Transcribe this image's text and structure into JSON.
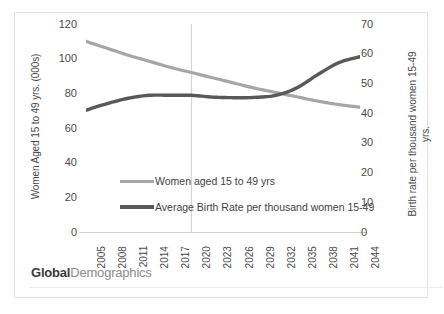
{
  "chart_data": {
    "type": "line",
    "title": "",
    "xlabel": "",
    "grid": false,
    "legend_position": "inside-center",
    "x": [
      2005,
      2008,
      2011,
      2014,
      2017,
      2020,
      2023,
      2026,
      2029,
      2032,
      2035,
      2038,
      2041,
      2044
    ],
    "axes": {
      "left": {
        "label": "Women Aged 15 to 49 yrs. (000s)",
        "ticks": [
          0,
          20,
          40,
          60,
          80,
          100,
          120
        ],
        "lim": [
          0,
          120
        ]
      },
      "right": {
        "label_line1": "Birth rate per thousand women 15-49",
        "label_line2": "yrs.",
        "ticks": [
          0,
          10,
          20,
          30,
          40,
          50,
          60,
          70
        ],
        "lim": [
          0,
          70
        ]
      }
    },
    "series": [
      {
        "name": "Women aged 15 to 49 yrs",
        "axis": "left",
        "color": "#a6a6a6",
        "values": [
          110,
          106,
          102,
          98.5,
          95,
          92,
          89,
          86,
          83,
          80.5,
          78,
          75.5,
          73.5,
          72
        ]
      },
      {
        "name": "Average Birth Rate per thousand women 15-49",
        "axis": "right",
        "color": "#595959",
        "values": [
          41,
          43.2,
          45,
          46,
          46,
          46,
          45.4,
          45.2,
          45.3,
          46,
          48.5,
          53,
          57,
          59
        ]
      }
    ],
    "reference_line": {
      "x": 2020,
      "color": "#d0d0d0"
    }
  },
  "legend": {
    "items": [
      {
        "label": "Women aged 15 to 49 yrs",
        "color": "#a6a6a6"
      },
      {
        "label": "Average Birth Rate per thousand women 15-49",
        "color": "#595959"
      }
    ]
  },
  "watermark": {
    "bold": "Global",
    "light": "Demographics"
  }
}
